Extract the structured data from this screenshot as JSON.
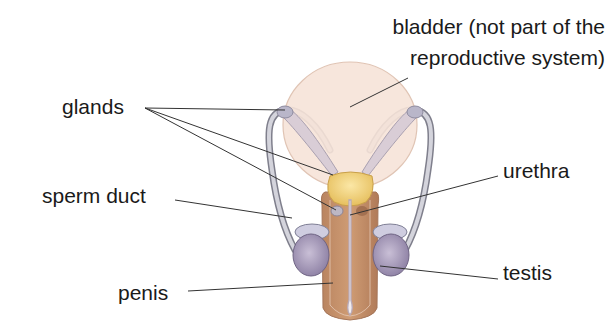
{
  "diagram": {
    "labels": {
      "bladder_line1": "bladder (not part of the",
      "bladder_line2": "reproductive system)",
      "glands": "glands",
      "sperm_duct": "sperm duct",
      "urethra": "urethra",
      "penis": "penis",
      "testis": "testis"
    },
    "colors": {
      "bladder": "#f6e3d8",
      "bladder_outline": "#e0c4b4",
      "gland_yellow": "#f2d27c",
      "penis_tissue": "#c4926a",
      "urethra": "#ece6ea",
      "testis": "#a79bb8",
      "duct": "#c9c9d2",
      "leader_line": "#333333",
      "text": "#1a1a1a"
    }
  }
}
